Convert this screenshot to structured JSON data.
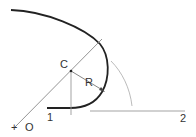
{
  "diagram": {
    "labels": {
      "center": "C",
      "radius": "R",
      "origin": "O",
      "point1": "1",
      "point2": "2",
      "origin_mark": "+"
    },
    "colors": {
      "thick_curve": "#222222",
      "thin_line": "#888888",
      "text": "#333333"
    }
  }
}
